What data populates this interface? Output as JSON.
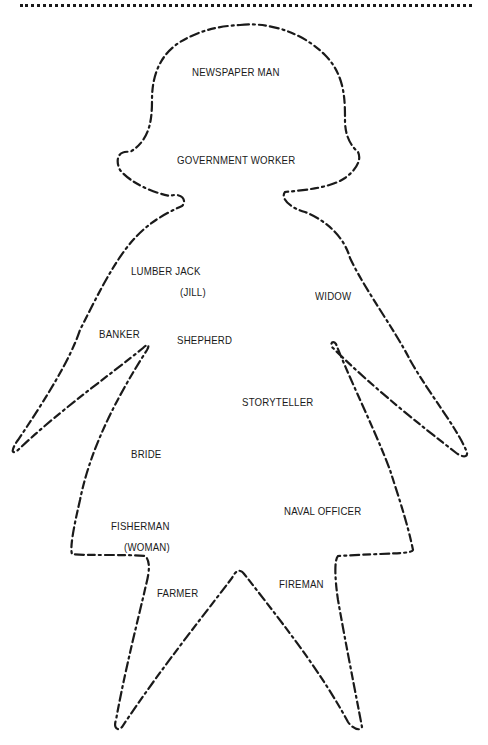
{
  "page": {
    "type": "worksheet-illustration",
    "outline_color": "#1a1a1a",
    "background": "#ffffff"
  },
  "figure": {
    "shape": "dashed-outline-girl-figure",
    "labels": [
      {
        "id": "newspaper-man",
        "text": "NEWSPAPER MAN",
        "x": 192,
        "y": 66
      },
      {
        "id": "government-worker",
        "text": "GOVERNMENT WORKER",
        "x": 177,
        "y": 154
      },
      {
        "id": "lumber-jack",
        "text": "LUMBER JACK",
        "x": 131,
        "y": 265
      },
      {
        "id": "jill",
        "text": "(JILL)",
        "x": 180,
        "y": 286
      },
      {
        "id": "widow",
        "text": "WIDOW",
        "x": 315,
        "y": 290
      },
      {
        "id": "banker",
        "text": "BANKER",
        "x": 99,
        "y": 328
      },
      {
        "id": "shepherd",
        "text": "SHEPHERD",
        "x": 177,
        "y": 334
      },
      {
        "id": "storyteller",
        "text": "STORYTELLER",
        "x": 242,
        "y": 396
      },
      {
        "id": "bride",
        "text": "BRIDE",
        "x": 131,
        "y": 448
      },
      {
        "id": "naval-officer",
        "text": "NAVAL OFFICER",
        "x": 284,
        "y": 505
      },
      {
        "id": "fisherman",
        "text": "FISHERMAN",
        "x": 111,
        "y": 520
      },
      {
        "id": "woman",
        "text": "(WOMAN)",
        "x": 124,
        "y": 541
      },
      {
        "id": "fireman",
        "text": "FIREMAN",
        "x": 279,
        "y": 578
      },
      {
        "id": "farmer",
        "text": "FARMER",
        "x": 157,
        "y": 587
      }
    ]
  }
}
